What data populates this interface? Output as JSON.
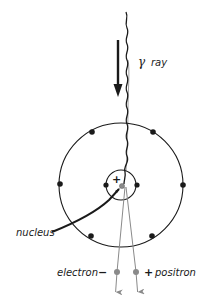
{
  "diagram": {
    "type": "pair-production",
    "labels": {
      "gamma_symbol": "γ",
      "gamma_text": "ray",
      "nucleus": "nucleus",
      "electron": "electron",
      "electron_sign": "−",
      "positron": "positron",
      "positron_sign": "+",
      "nucleus_charge": "+"
    },
    "colors": {
      "ink": "#1a1a1a",
      "particle": "#8a8a8a",
      "background": "#ffffff"
    },
    "atom": {
      "center": [
        121,
        185
      ],
      "outer_shell_radius": 62,
      "inner_shell_radius": 15,
      "outer_electrons": 6,
      "inner_electrons": 2
    }
  }
}
